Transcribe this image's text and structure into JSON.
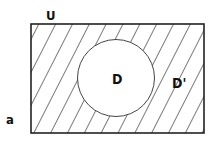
{
  "diagram": {
    "type": "venn-complement",
    "universe_label": "U",
    "set_label": "D",
    "complement_label": "D'",
    "panel_label": "a",
    "shaded_region": "complement",
    "colors": {
      "stroke": "#222222",
      "background": "#ffffff"
    }
  }
}
